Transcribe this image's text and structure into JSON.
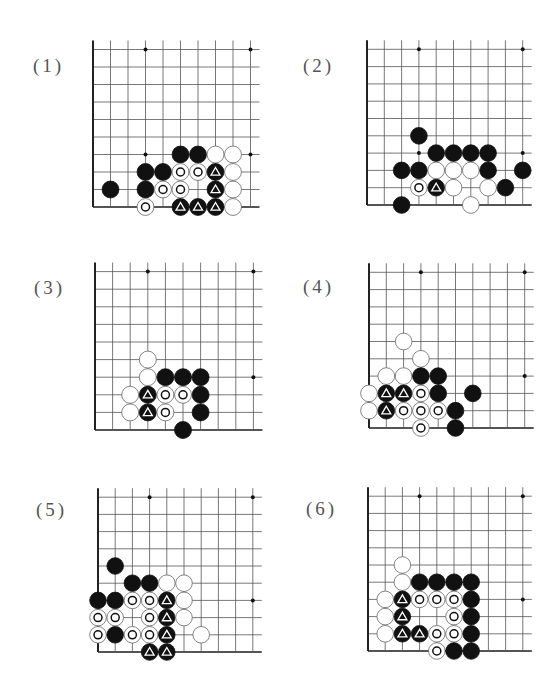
{
  "page": {
    "colors": {
      "grid": "#555555",
      "edge": "#222222",
      "black_stone": "#111111",
      "white_stone": "#ffffff",
      "white_stroke": "#666666",
      "label": "#555555",
      "star": "#111111"
    }
  },
  "legend": {
    "black": "black stone",
    "white": "white stone",
    "black-tri": "black stone marked with triangle",
    "white-circle": "white stone marked with circle"
  },
  "problems": [
    {
      "label": "(1)",
      "label_pos": [
        33,
        55
      ],
      "origin": [
        93,
        207
      ],
      "spacing": 17.5,
      "cols": 10,
      "rows": 10,
      "extend_right": 9,
      "extend_top": 9,
      "stars": [
        [
          3,
          3
        ],
        [
          9,
          3
        ],
        [
          3,
          9
        ],
        [
          9,
          9
        ]
      ],
      "stones": [
        {
          "c": 5,
          "r": 3,
          "t": "black"
        },
        {
          "c": 6,
          "r": 3,
          "t": "black"
        },
        {
          "c": 7,
          "r": 3,
          "t": "white"
        },
        {
          "c": 8,
          "r": 3,
          "t": "white"
        },
        {
          "c": 3,
          "r": 2,
          "t": "black"
        },
        {
          "c": 4,
          "r": 2,
          "t": "black"
        },
        {
          "c": 5,
          "r": 2,
          "t": "white-circle"
        },
        {
          "c": 6,
          "r": 2,
          "t": "white-circle"
        },
        {
          "c": 7,
          "r": 2,
          "t": "black-tri"
        },
        {
          "c": 8,
          "r": 2,
          "t": "white"
        },
        {
          "c": 1,
          "r": 1,
          "t": "black"
        },
        {
          "c": 3,
          "r": 1,
          "t": "black"
        },
        {
          "c": 4,
          "r": 1,
          "t": "white-circle"
        },
        {
          "c": 5,
          "r": 1,
          "t": "white-circle"
        },
        {
          "c": 7,
          "r": 1,
          "t": "black-tri"
        },
        {
          "c": 8,
          "r": 1,
          "t": "white"
        },
        {
          "c": 3,
          "r": 0,
          "t": "white-circle"
        },
        {
          "c": 5,
          "r": 0,
          "t": "black-tri"
        },
        {
          "c": 6,
          "r": 0,
          "t": "black-tri"
        },
        {
          "c": 7,
          "r": 0,
          "t": "black-tri"
        },
        {
          "c": 8,
          "r": 0,
          "t": "white"
        }
      ]
    },
    {
      "label": "(2)",
      "label_pos": [
        303,
        55
      ],
      "origin": [
        367,
        205
      ],
      "spacing": 17.3,
      "cols": 10,
      "rows": 10,
      "extend_right": 9,
      "extend_top": 9,
      "stars": [
        [
          3,
          3
        ],
        [
          9,
          3
        ],
        [
          3,
          9
        ],
        [
          9,
          9
        ]
      ],
      "stones": [
        {
          "c": 3,
          "r": 4,
          "t": "black"
        },
        {
          "c": 4,
          "r": 3,
          "t": "black"
        },
        {
          "c": 5,
          "r": 3,
          "t": "black"
        },
        {
          "c": 6,
          "r": 3,
          "t": "black"
        },
        {
          "c": 7,
          "r": 3,
          "t": "black"
        },
        {
          "c": 2,
          "r": 2,
          "t": "black"
        },
        {
          "c": 3,
          "r": 2,
          "t": "black"
        },
        {
          "c": 4,
          "r": 2,
          "t": "white"
        },
        {
          "c": 5,
          "r": 2,
          "t": "white"
        },
        {
          "c": 6,
          "r": 2,
          "t": "white"
        },
        {
          "c": 7,
          "r": 2,
          "t": "black"
        },
        {
          "c": 9,
          "r": 2,
          "t": "black"
        },
        {
          "c": 3,
          "r": 1,
          "t": "white-circle"
        },
        {
          "c": 4,
          "r": 1,
          "t": "black-tri"
        },
        {
          "c": 5,
          "r": 1,
          "t": "white"
        },
        {
          "c": 7,
          "r": 1,
          "t": "white"
        },
        {
          "c": 8,
          "r": 1,
          "t": "black"
        },
        {
          "c": 2,
          "r": 0,
          "t": "black"
        },
        {
          "c": 6,
          "r": 0,
          "t": "white"
        }
      ]
    },
    {
      "label": "(3)",
      "label_pos": [
        34,
        277
      ],
      "origin": [
        95,
        430
      ],
      "spacing": 17.6,
      "cols": 10,
      "rows": 10,
      "extend_right": 9,
      "extend_top": 9,
      "stars": [
        [
          3,
          3
        ],
        [
          9,
          3
        ],
        [
          3,
          9
        ],
        [
          9,
          9
        ]
      ],
      "stones": [
        {
          "c": 3,
          "r": 4,
          "t": "white"
        },
        {
          "c": 3,
          "r": 3,
          "t": "white"
        },
        {
          "c": 4,
          "r": 3,
          "t": "black"
        },
        {
          "c": 5,
          "r": 3,
          "t": "black"
        },
        {
          "c": 6,
          "r": 3,
          "t": "black"
        },
        {
          "c": 2,
          "r": 2,
          "t": "white"
        },
        {
          "c": 3,
          "r": 2,
          "t": "black-tri"
        },
        {
          "c": 4,
          "r": 2,
          "t": "white-circle"
        },
        {
          "c": 5,
          "r": 2,
          "t": "white-circle"
        },
        {
          "c": 6,
          "r": 2,
          "t": "black"
        },
        {
          "c": 2,
          "r": 1,
          "t": "white"
        },
        {
          "c": 3,
          "r": 1,
          "t": "black-tri"
        },
        {
          "c": 4,
          "r": 1,
          "t": "white-circle"
        },
        {
          "c": 6,
          "r": 1,
          "t": "black"
        },
        {
          "c": 5,
          "r": 0,
          "t": "black"
        }
      ]
    },
    {
      "label": "(4)",
      "label_pos": [
        303,
        276
      ],
      "origin": [
        369,
        428
      ],
      "spacing": 17.3,
      "cols": 10,
      "rows": 10,
      "extend_right": 9,
      "extend_top": 9,
      "stars": [
        [
          3,
          3
        ],
        [
          9,
          3
        ],
        [
          3,
          9
        ],
        [
          9,
          9
        ]
      ],
      "stones": [
        {
          "c": 2,
          "r": 5,
          "t": "white"
        },
        {
          "c": 3,
          "r": 4,
          "t": "white"
        },
        {
          "c": 1,
          "r": 3,
          "t": "white"
        },
        {
          "c": 2,
          "r": 3,
          "t": "white"
        },
        {
          "c": 3,
          "r": 3,
          "t": "black"
        },
        {
          "c": 4,
          "r": 3,
          "t": "black"
        },
        {
          "c": 0,
          "r": 2,
          "t": "white"
        },
        {
          "c": 1,
          "r": 2,
          "t": "black-tri"
        },
        {
          "c": 2,
          "r": 2,
          "t": "black-tri"
        },
        {
          "c": 3,
          "r": 2,
          "t": "white-circle"
        },
        {
          "c": 4,
          "r": 2,
          "t": "black"
        },
        {
          "c": 6,
          "r": 2,
          "t": "black"
        },
        {
          "c": 0,
          "r": 1,
          "t": "white"
        },
        {
          "c": 1,
          "r": 1,
          "t": "black-tri"
        },
        {
          "c": 2,
          "r": 1,
          "t": "white-circle"
        },
        {
          "c": 3,
          "r": 1,
          "t": "white-circle"
        },
        {
          "c": 4,
          "r": 1,
          "t": "white-circle"
        },
        {
          "c": 5,
          "r": 1,
          "t": "black"
        },
        {
          "c": 3,
          "r": 0,
          "t": "white-circle"
        },
        {
          "c": 5,
          "r": 0,
          "t": "black"
        }
      ]
    },
    {
      "label": "(5)",
      "label_pos": [
        36,
        499
      ],
      "origin": [
        98,
        652
      ],
      "spacing": 17.2,
      "cols": 10,
      "rows": 10,
      "extend_right": 9,
      "extend_top": 9,
      "stars": [
        [
          3,
          3
        ],
        [
          9,
          3
        ],
        [
          3,
          9
        ],
        [
          9,
          9
        ]
      ],
      "stones": [
        {
          "c": 1,
          "r": 5,
          "t": "black"
        },
        {
          "c": 2,
          "r": 4,
          "t": "black"
        },
        {
          "c": 3,
          "r": 4,
          "t": "black"
        },
        {
          "c": 4,
          "r": 4,
          "t": "white"
        },
        {
          "c": 5,
          "r": 4,
          "t": "white"
        },
        {
          "c": 0,
          "r": 3,
          "t": "black"
        },
        {
          "c": 1,
          "r": 3,
          "t": "black"
        },
        {
          "c": 2,
          "r": 3,
          "t": "white-circle"
        },
        {
          "c": 3,
          "r": 3,
          "t": "white-circle"
        },
        {
          "c": 4,
          "r": 3,
          "t": "black-tri"
        },
        {
          "c": 5,
          "r": 3,
          "t": "white"
        },
        {
          "c": 0,
          "r": 2,
          "t": "white-circle"
        },
        {
          "c": 1,
          "r": 2,
          "t": "white-circle"
        },
        {
          "c": 3,
          "r": 2,
          "t": "white-circle"
        },
        {
          "c": 4,
          "r": 2,
          "t": "black-tri"
        },
        {
          "c": 5,
          "r": 2,
          "t": "white"
        },
        {
          "c": 0,
          "r": 1,
          "t": "white-circle"
        },
        {
          "c": 1,
          "r": 1,
          "t": "black"
        },
        {
          "c": 2,
          "r": 1,
          "t": "white-circle"
        },
        {
          "c": 3,
          "r": 1,
          "t": "white-circle"
        },
        {
          "c": 4,
          "r": 1,
          "t": "black-tri"
        },
        {
          "c": 6,
          "r": 1,
          "t": "white"
        },
        {
          "c": 3,
          "r": 0,
          "t": "black-tri"
        },
        {
          "c": 4,
          "r": 0,
          "t": "black-tri"
        }
      ]
    },
    {
      "label": "(6)",
      "label_pos": [
        306,
        498
      ],
      "origin": [
        368,
        651
      ],
      "spacing": 17.2,
      "cols": 10,
      "rows": 10,
      "extend_right": 9,
      "extend_top": 9,
      "stars": [
        [
          3,
          3
        ],
        [
          9,
          3
        ],
        [
          3,
          9
        ],
        [
          9,
          9
        ]
      ],
      "stones": [
        {
          "c": 2,
          "r": 5,
          "t": "white"
        },
        {
          "c": 2,
          "r": 4,
          "t": "white"
        },
        {
          "c": 3,
          "r": 4,
          "t": "black"
        },
        {
          "c": 4,
          "r": 4,
          "t": "black"
        },
        {
          "c": 5,
          "r": 4,
          "t": "black"
        },
        {
          "c": 6,
          "r": 4,
          "t": "black"
        },
        {
          "c": 1,
          "r": 3,
          "t": "white"
        },
        {
          "c": 2,
          "r": 3,
          "t": "black-tri"
        },
        {
          "c": 3,
          "r": 3,
          "t": "white-circle"
        },
        {
          "c": 4,
          "r": 3,
          "t": "white-circle"
        },
        {
          "c": 5,
          "r": 3,
          "t": "white-circle"
        },
        {
          "c": 6,
          "r": 3,
          "t": "black"
        },
        {
          "c": 1,
          "r": 2,
          "t": "white"
        },
        {
          "c": 2,
          "r": 2,
          "t": "black-tri"
        },
        {
          "c": 5,
          "r": 2,
          "t": "white-circle"
        },
        {
          "c": 6,
          "r": 2,
          "t": "black"
        },
        {
          "c": 1,
          "r": 1,
          "t": "white"
        },
        {
          "c": 2,
          "r": 1,
          "t": "black-tri"
        },
        {
          "c": 3,
          "r": 1,
          "t": "black-tri"
        },
        {
          "c": 4,
          "r": 1,
          "t": "white-circle"
        },
        {
          "c": 5,
          "r": 1,
          "t": "white-circle"
        },
        {
          "c": 6,
          "r": 1,
          "t": "black"
        },
        {
          "c": 4,
          "r": 0,
          "t": "white-circle"
        },
        {
          "c": 5,
          "r": 0,
          "t": "black"
        },
        {
          "c": 6,
          "r": 0,
          "t": "black"
        }
      ]
    }
  ]
}
